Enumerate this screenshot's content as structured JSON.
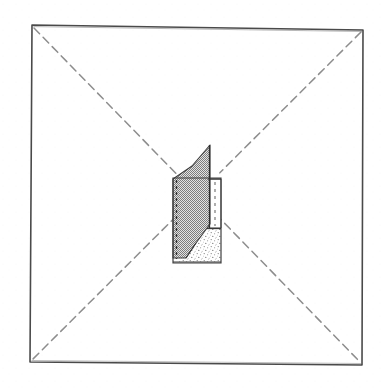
{
  "figure": {
    "title": "Plan diagram of a square enclosure with central wall element",
    "canvas": {
      "width": 385,
      "height": 391,
      "background": "#ffffff"
    },
    "style": {
      "ink_color": "#4a4a4a",
      "ink_color_dark": "#2e2e2e",
      "dash_color": "#8d8d8d",
      "hatch_fill": "#9a9a9a",
      "stipple_fill": "#d9d9d9",
      "panel_fill": "#ffffff",
      "square_stroke_width": 1.6,
      "dash_pattern": "8 5",
      "dash_stroke_width": 1.5
    },
    "square_outline": {
      "label": "square-enclosure-outline",
      "points": "32,25 363,30 362,365 30,362",
      "closed": true
    },
    "diagonals": [
      {
        "label": "diagonal-top-left-to-bottom-right",
        "x1": 34,
        "y1": 28,
        "x2": 360,
        "y2": 362
      },
      {
        "label": "diagonal-top-right-to-bottom-left",
        "x1": 361,
        "y1": 32,
        "x2": 32,
        "y2": 360
      }
    ],
    "central_object": {
      "label": "central-wall-element",
      "bounding_box": {
        "x": 172,
        "y": 145,
        "width": 50,
        "height": 120
      },
      "parts": [
        {
          "label": "outer-box-outline",
          "points": "173,178 221,178 221,263 173,263",
          "fill": "none"
        },
        {
          "label": "hatched-wall-face",
          "points": "173,178 192,166 210,145 210,224 196,243 186,258 173,258",
          "fill": "hatch"
        },
        {
          "label": "white-panel",
          "points": "209,179 221,179 221,228 209,228",
          "fill": "panel"
        },
        {
          "label": "stippled-floor-area",
          "points": "209,229 221,229 221,262 176,262 186,258 196,243 209,229",
          "fill": "stipple"
        }
      ],
      "dashed_details": [
        {
          "label": "dashed-left-jamb-line",
          "x1": 176,
          "y1": 180,
          "x2": 176,
          "y2": 259
        },
        {
          "label": "dashed-panel-centre-line",
          "x1": 215,
          "y1": 182,
          "x2": 215,
          "y2": 226
        }
      ],
      "solid_details": [
        {
          "label": "panel-top-edge",
          "x1": 208,
          "y1": 179,
          "x2": 221,
          "y2": 179
        },
        {
          "label": "panel-bottom-edge",
          "x1": 208,
          "y1": 228,
          "x2": 221,
          "y2": 228
        },
        {
          "label": "wall-leading-edge",
          "x1": 209,
          "y1": 145,
          "x2": 209,
          "y2": 229
        },
        {
          "label": "base-line",
          "x1": 173,
          "y1": 262,
          "x2": 221,
          "y2": 262
        }
      ]
    }
  }
}
